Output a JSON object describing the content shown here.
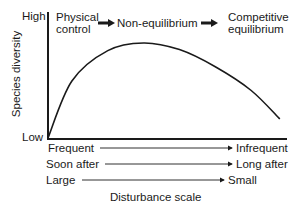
{
  "diagram": {
    "y_axis": {
      "label": "Species diversity",
      "high_label": "High",
      "low_label": "Low"
    },
    "x_axis": {
      "label": "Disturbance scale",
      "scales": [
        {
          "from": "Frequent",
          "to": "Infrequent"
        },
        {
          "from": "Soon after",
          "to": "Long after"
        },
        {
          "from": "Large",
          "to": "Small"
        }
      ]
    },
    "stages": [
      {
        "line1": "Physical",
        "line2": "control"
      },
      {
        "line1": "Non-equilibrium",
        "line2": ""
      },
      {
        "line1": "Competitive",
        "line2": "equilibrium"
      }
    ],
    "curve": {
      "description": "Hump-shaped: diversity rises from low at frequent/large disturbance, peaks at intermediate disturbance, declines toward infrequent/small disturbance",
      "points": [
        [
          0,
          0.0
        ],
        [
          0.1,
          0.6
        ],
        [
          0.25,
          0.92
        ],
        [
          0.4,
          1.0
        ],
        [
          0.55,
          0.93
        ],
        [
          0.7,
          0.75
        ],
        [
          0.85,
          0.5
        ],
        [
          0.97,
          0.2
        ]
      ]
    },
    "line_color": "#1a1a1a"
  }
}
